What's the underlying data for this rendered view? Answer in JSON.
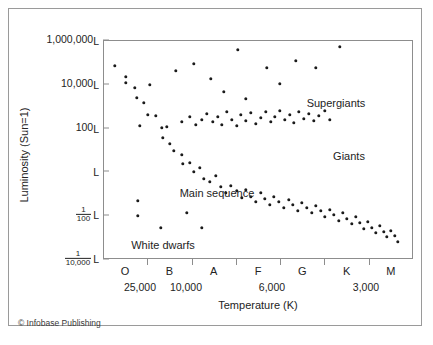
{
  "figure": {
    "credit": "© Infobase Publishing",
    "axis_color": "#8d8d8d",
    "dot_color": "#1b1b1b",
    "text_color": "#232323",
    "background": "#ffffff"
  },
  "chart_data": {
    "type": "scatter",
    "title": "",
    "xlabel": "Temperature (K)",
    "ylabel": "Luminosity (Sun=1)",
    "x_axis": {
      "spectral_classes": [
        "O",
        "B",
        "A",
        "F",
        "G",
        "K",
        "M"
      ],
      "temperature_ticks": [
        "25,000",
        "10,000",
        "6,000",
        "3,000"
      ],
      "direction": "decreasing temperature to the right"
    },
    "y_axis": {
      "scale": "log",
      "tick_labels": [
        "1,000,000L",
        "10,000L",
        "100L",
        "L",
        "1/100 L",
        "1/10,000 L"
      ],
      "tick_values": [
        1000000,
        10000,
        100,
        1,
        0.01,
        0.0001
      ],
      "ticks": [
        {
          "whole": "1,000,000",
          "unit": "L",
          "num": "",
          "den": ""
        },
        {
          "whole": "10,000",
          "unit": "L",
          "num": "",
          "den": ""
        },
        {
          "whole": "100",
          "unit": "L",
          "num": "",
          "den": ""
        },
        {
          "whole": "",
          "unit": "L",
          "num": "",
          "den": ""
        },
        {
          "whole": "",
          "unit": "L",
          "num": "1",
          "den": "100"
        },
        {
          "whole": "",
          "unit": "L",
          "num": "1",
          "den": "10,000"
        }
      ]
    },
    "annotations": [
      {
        "label": "Supergiants",
        "x": 232,
        "y": 62
      },
      {
        "label": "Giants",
        "x": 245,
        "y": 115
      },
      {
        "label": "Main sequence",
        "x": 113,
        "y": 152
      },
      {
        "label": "White dwarfs",
        "x": 59,
        "y": 204
      }
    ],
    "series": [
      {
        "name": "Main sequence",
        "points": [
          [
            11,
            25
          ],
          [
            22,
            36
          ],
          [
            31,
            47
          ],
          [
            33,
            57
          ],
          [
            40,
            62
          ],
          [
            44,
            74
          ],
          [
            52,
            75
          ],
          [
            58,
            87
          ],
          [
            59,
            97
          ],
          [
            66,
            103
          ],
          [
            70,
            110
          ],
          [
            78,
            114
          ],
          [
            79,
            123
          ],
          [
            86,
            122
          ],
          [
            90,
            131
          ],
          [
            96,
            127
          ],
          [
            100,
            138
          ],
          [
            106,
            141
          ],
          [
            112,
            135
          ],
          [
            117,
            146
          ],
          [
            122,
            152
          ],
          [
            127,
            145
          ],
          [
            133,
            150
          ],
          [
            138,
            157
          ],
          [
            142,
            149
          ],
          [
            147,
            156
          ],
          [
            152,
            161
          ],
          [
            157,
            152
          ],
          [
            161,
            158
          ],
          [
            166,
            164
          ],
          [
            170,
            156
          ],
          [
            175,
            161
          ],
          [
            180,
            167
          ],
          [
            185,
            159
          ],
          [
            189,
            164
          ],
          [
            194,
            170
          ],
          [
            198,
            162
          ],
          [
            203,
            167
          ],
          [
            208,
            172
          ],
          [
            212,
            165
          ],
          [
            217,
            170
          ],
          [
            221,
            176
          ],
          [
            226,
            169
          ],
          [
            230,
            174
          ],
          [
            235,
            180
          ],
          [
            239,
            172
          ],
          [
            243,
            178
          ],
          [
            248,
            183
          ],
          [
            252,
            176
          ],
          [
            256,
            182
          ],
          [
            260,
            188
          ],
          [
            264,
            181
          ],
          [
            268,
            187
          ],
          [
            272,
            192
          ],
          [
            276,
            185
          ],
          [
            280,
            191
          ],
          [
            283,
            196
          ],
          [
            287,
            190
          ],
          [
            291,
            195
          ],
          [
            294,
            201
          ]
        ]
      },
      {
        "name": "Giants",
        "points": [
          [
            36,
            85
          ],
          [
            63,
            86
          ],
          [
            78,
            81
          ],
          [
            86,
            76
          ],
          [
            92,
            84
          ],
          [
            98,
            79
          ],
          [
            103,
            73
          ],
          [
            109,
            81
          ],
          [
            114,
            76
          ],
          [
            118,
            84
          ],
          [
            123,
            71
          ],
          [
            128,
            79
          ],
          [
            133,
            85
          ],
          [
            137,
            74
          ],
          [
            142,
            80
          ],
          [
            147,
            72
          ],
          [
            152,
            83
          ],
          [
            157,
            77
          ],
          [
            162,
            71
          ],
          [
            167,
            81
          ],
          [
            171,
            76
          ],
          [
            176,
            70
          ],
          [
            181,
            79
          ],
          [
            186,
            74
          ],
          [
            190,
            82
          ],
          [
            195,
            71
          ],
          [
            200,
            78
          ],
          [
            205,
            73
          ],
          [
            210,
            80
          ],
          [
            215,
            75
          ],
          [
            221,
            70
          ],
          [
            226,
            79
          ]
        ]
      },
      {
        "name": "Supergiants",
        "points": [
          [
            22,
            42
          ],
          [
            46,
            44
          ],
          [
            72,
            30
          ],
          [
            90,
            23
          ],
          [
            107,
            38
          ],
          [
            120,
            51
          ],
          [
            134,
            9
          ],
          [
            142,
            58
          ],
          [
            163,
            27
          ],
          [
            176,
            43
          ],
          [
            192,
            20
          ],
          [
            212,
            27
          ],
          [
            236,
            6
          ]
        ]
      },
      {
        "name": "White dwarfs",
        "points": [
          [
            34,
            160
          ],
          [
            34,
            175
          ],
          [
            57,
            187
          ],
          [
            83,
            172
          ],
          [
            98,
            187
          ]
        ]
      }
    ]
  }
}
